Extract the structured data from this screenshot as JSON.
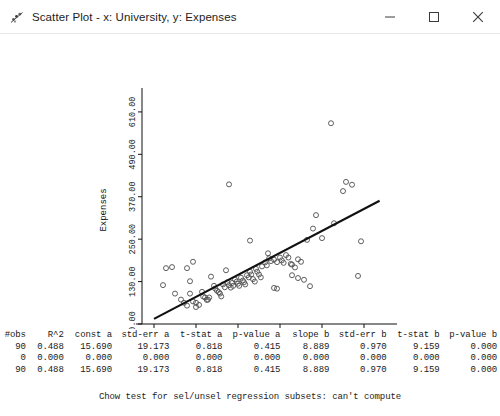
{
  "window": {
    "title": "Scatter Plot - x: University, y: Expenses",
    "icon": "chart-app-icon",
    "minimize_label": "–",
    "maximize_label": "□",
    "close_label": "✕"
  },
  "chart_data": {
    "type": "scatter",
    "title": "",
    "xlabel": "University",
    "ylabel": "Expenses",
    "xlim": [
      -1.0,
      39.5
    ],
    "ylim": [
      10.0,
      655.0
    ],
    "xticks": [
      "1.00",
      "8.00",
      "15.00",
      "22.00",
      "29.00",
      "36.00"
    ],
    "xtick_values": [
      1,
      8,
      15,
      22,
      29,
      36
    ],
    "yticks": [
      "10.00",
      "130.00",
      "250.00",
      "370.00",
      "490.00",
      "610.00"
    ],
    "ytick_values": [
      10,
      130,
      250,
      370,
      490,
      610
    ],
    "grid": false,
    "legend": false,
    "marker": "open-circle",
    "point_color": "#4d4d4d",
    "line_color": "#111111",
    "fit_line": {
      "name": "regression line",
      "intercept": 15.69,
      "slope": 8.889,
      "x_start": 1.0,
      "x_end": 38.6
    },
    "points": [
      [
        3.0,
        168.0
      ],
      [
        4.0,
        171.0
      ],
      [
        6.5,
        168.0
      ],
      [
        2.5,
        120.0
      ],
      [
        4.5,
        96.0
      ],
      [
        5.5,
        79.0
      ],
      [
        6.0,
        70.0
      ],
      [
        6.5,
        62.0
      ],
      [
        7.0,
        96.0
      ],
      [
        7.5,
        74.0
      ],
      [
        8.0,
        70.0
      ],
      [
        8.0,
        58.0
      ],
      [
        8.5,
        64.0
      ],
      [
        9.0,
        101.0
      ],
      [
        9.2,
        88.0
      ],
      [
        9.5,
        85.0
      ],
      [
        9.8,
        78.0
      ],
      [
        10.0,
        79.0
      ],
      [
        10.2,
        85.0
      ],
      [
        10.5,
        144.0
      ],
      [
        7.5,
        186.0
      ],
      [
        7.0,
        131.0
      ],
      [
        11.0,
        118.0
      ],
      [
        11.2,
        110.0
      ],
      [
        11.5,
        104.0
      ],
      [
        11.8,
        100.0
      ],
      [
        12.0,
        96.0
      ],
      [
        12.2,
        88.0
      ],
      [
        12.5,
        122.0
      ],
      [
        12.8,
        114.0
      ],
      [
        13.0,
        162.0
      ],
      [
        13.2,
        128.0
      ],
      [
        13.5,
        120.0
      ],
      [
        13.8,
        113.0
      ],
      [
        14.0,
        126.0
      ],
      [
        14.2,
        118.0
      ],
      [
        14.5,
        136.0
      ],
      [
        14.8,
        130.0
      ],
      [
        15.0,
        124.0
      ],
      [
        15.2,
        118.0
      ],
      [
        15.5,
        141.0
      ],
      [
        15.8,
        133.0
      ],
      [
        16.0,
        128.0
      ],
      [
        16.2,
        122.0
      ],
      [
        16.5,
        148.0
      ],
      [
        16.8,
        142.0
      ],
      [
        17.0,
        158.0
      ],
      [
        17.2,
        150.0
      ],
      [
        17.5,
        137.0
      ],
      [
        17.8,
        130.0
      ],
      [
        18.0,
        166.0
      ],
      [
        18.2,
        158.0
      ],
      [
        18.5,
        150.0
      ],
      [
        18.8,
        142.0
      ],
      [
        19.0,
        173.0
      ],
      [
        19.5,
        184.0
      ],
      [
        19.8,
        176.0
      ],
      [
        20.0,
        210.0
      ],
      [
        20.2,
        196.0
      ],
      [
        20.5,
        188.0
      ],
      [
        17.0,
        246.0
      ],
      [
        21.0,
        192.0
      ],
      [
        21.5,
        185.0
      ],
      [
        21.0,
        112.0
      ],
      [
        21.5,
        110.0
      ],
      [
        22.0,
        198.0
      ],
      [
        22.3,
        190.0
      ],
      [
        22.6,
        183.0
      ],
      [
        23.0,
        205.0
      ],
      [
        23.4,
        198.0
      ],
      [
        23.8,
        180.0
      ],
      [
        24.0,
        178.0
      ],
      [
        24.5,
        170.0
      ],
      [
        25.0,
        193.0
      ],
      [
        25.5,
        186.0
      ],
      [
        24.0,
        148.0
      ],
      [
        25.0,
        140.0
      ],
      [
        26.0,
        135.0
      ],
      [
        26.5,
        248.0
      ],
      [
        27.5,
        280.0
      ],
      [
        28.0,
        318.0
      ],
      [
        29.0,
        253.0
      ],
      [
        27.0,
        117.0
      ],
      [
        31.0,
        295.0
      ],
      [
        32.5,
        386.0
      ],
      [
        33.0,
        412.0
      ],
      [
        34.0,
        404.0
      ],
      [
        30.5,
        578.0
      ],
      [
        13.5,
        405.0
      ],
      [
        35.5,
        244.0
      ],
      [
        35.0,
        146.0
      ]
    ]
  },
  "stats_table": {
    "headers": [
      "#obs",
      "R^2",
      "const a",
      "std-err a",
      "t-stat a",
      "p-value a",
      "slope b",
      "std-err b",
      "t-stat b",
      "p-value b"
    ],
    "rows": [
      [
        "90",
        "0.488",
        "15.690",
        "19.173",
        "0.818",
        "0.415",
        "8.889",
        "0.970",
        "9.159",
        "0.000"
      ],
      [
        "0",
        "0.000",
        "0.000",
        "0.000",
        "0.000",
        "0.000",
        "0.000",
        "0.000",
        "0.000",
        "0.000"
      ],
      [
        "90",
        "0.488",
        "15.690",
        "19.173",
        "0.818",
        "0.415",
        "8.889",
        "0.970",
        "9.159",
        "0.000"
      ]
    ]
  },
  "chow_note": "Chow test for sel/unsel regression subsets: can't compute"
}
